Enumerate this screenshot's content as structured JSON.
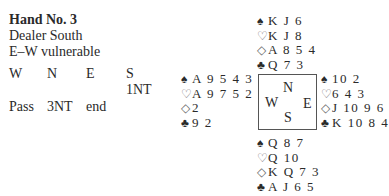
{
  "header": {
    "title": "Hand No. 3",
    "dealer": "Dealer South",
    "vulnerability": "E–W vulnerable"
  },
  "auction": {
    "columns": [
      "W",
      "N",
      "E",
      "S"
    ],
    "rows": [
      [
        "",
        "",
        "",
        "1NT"
      ],
      [
        "Pass",
        "3NT",
        "end",
        ""
      ]
    ]
  },
  "hands": {
    "north": {
      "spades": "K J 6",
      "hearts": "K J 8",
      "diamonds": "A 8 5 4",
      "clubs": "Q 7 3"
    },
    "west": {
      "spades": "A 9 5 4 3",
      "hearts": "A 9 7 5 2",
      "diamonds": "2",
      "clubs": "9 2"
    },
    "east": {
      "spades": "10 2",
      "hearts": "6 4 3",
      "diamonds": "J 10 9 6",
      "clubs": "K 10 8 4"
    },
    "south": {
      "spades": "Q 8 7",
      "hearts": "Q 10",
      "diamonds": "K Q 7 3",
      "clubs": "A J 6 5"
    }
  },
  "suits": {
    "spades": "♠",
    "hearts": "♡",
    "diamonds": "◇",
    "clubs": "♣"
  },
  "compass": {
    "n": "N",
    "w": "W",
    "e": "E",
    "s": "S"
  }
}
